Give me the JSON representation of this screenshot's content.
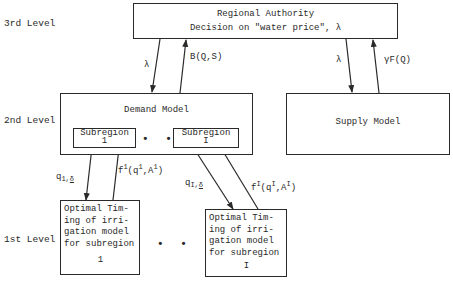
{
  "levels": {
    "third": "3rd Level",
    "second": "2nd Level",
    "first": "1st Level"
  },
  "regional_authority": {
    "title": "Regional Authority",
    "subtitle": "Decision on \"water price\", λ"
  },
  "demand_model": {
    "title": "Demand Model",
    "subregions": [
      {
        "label": "Subregion",
        "index": "1"
      },
      {
        "label": "Subregion",
        "index": "I"
      }
    ],
    "ellipsis": "• • •"
  },
  "supply_model": {
    "title": "Supply Model"
  },
  "arrows": {
    "ra_to_demand": "λ",
    "demand_to_ra": "B(Q,S)",
    "ra_to_supply": "λ",
    "supply_to_ra": "γF(Q)",
    "sub1_down": {
      "base": "q",
      "sub": "1,",
      "delta": "δ"
    },
    "sub1_up": {
      "f": "f",
      "sup": "1",
      "q": "(q",
      "qsup": "1",
      "a": ",A",
      "asup": "1",
      "close": ")"
    },
    "subI_down": {
      "base": "q",
      "sub": "I,",
      "delta": "δ"
    },
    "subI_up": {
      "f": "f",
      "sup": "I",
      "q": "(q",
      "qsup": "I",
      "a": ",A",
      "asup": "I",
      "close": ")"
    }
  },
  "first_level_models": [
    {
      "lines": [
        "Optimal Tim-",
        "ing of irri-",
        "gation model",
        "for subregion"
      ],
      "index": "1"
    },
    {
      "lines": [
        "Optimal Tim-",
        "ing of irri-",
        "gation model",
        "for subregion"
      ],
      "index": "I"
    }
  ],
  "first_level_ellipsis": "• • •",
  "colors": {
    "line": "#2a2a2a",
    "background": "#ffffff"
  }
}
